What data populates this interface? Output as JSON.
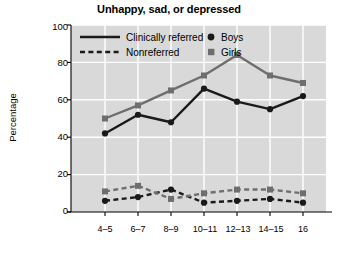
{
  "chart_data": {
    "type": "line",
    "title": "Unhappy, sad, or depressed",
    "xlabel": "Age",
    "ylabel": "Percentage",
    "categories": [
      "4–5",
      "6–7",
      "8–9",
      "10–11",
      "12–13",
      "14–15",
      "16"
    ],
    "ylim": [
      0,
      100
    ],
    "yticks": [
      0,
      20,
      40,
      60,
      80,
      100
    ],
    "grid": true,
    "legend_position": "top-left-inside",
    "series": [
      {
        "name": "Clinically referred — Boys",
        "line_style": "solid",
        "marker": "circle",
        "color": "#1a1a1a",
        "values": [
          42,
          52,
          48,
          66,
          59,
          55,
          62
        ]
      },
      {
        "name": "Clinically referred — Girls",
        "line_style": "solid",
        "marker": "square",
        "color": "#6e6e6e",
        "values": [
          50,
          57,
          65,
          73,
          84,
          73,
          69
        ]
      },
      {
        "name": "Nonreferred — Boys",
        "line_style": "dashed",
        "marker": "circle",
        "color": "#1a1a1a",
        "values": [
          6,
          8,
          12,
          5,
          6,
          7,
          5
        ]
      },
      {
        "name": "Nonreferred — Girls",
        "line_style": "dashed",
        "marker": "square",
        "color": "#6e6e6e",
        "values": [
          11,
          14,
          7,
          10,
          12,
          12,
          10
        ]
      }
    ],
    "legend_line_entries": [
      {
        "label": "Clinically referred",
        "style": "solid"
      },
      {
        "label": "Nonreferred",
        "style": "dashed"
      }
    ],
    "legend_marker_entries": [
      {
        "label": "Boys",
        "marker": "circle",
        "color": "#1a1a1a"
      },
      {
        "label": "Girls",
        "marker": "square",
        "color": "#6e6e6e"
      }
    ],
    "colors": {
      "plot_background": "#d9d9d9",
      "grid": "#ffffff",
      "axis": "#000000",
      "boys": "#1a1a1a",
      "girls": "#6e6e6e",
      "page_background": "#ffffff"
    }
  }
}
